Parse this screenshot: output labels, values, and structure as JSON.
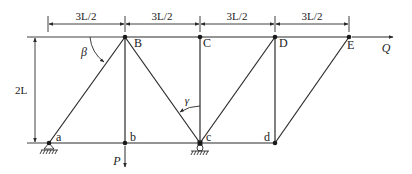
{
  "diagram": {
    "type": "truss",
    "colors": {
      "line": "#2a2a2a",
      "text": "#222222",
      "background": "#ffffff",
      "angle_label": "#555555"
    },
    "nodes": {
      "B": {
        "label": "B",
        "x": 125,
        "y": 37
      },
      "C": {
        "label": "C",
        "x": 200,
        "y": 37
      },
      "D": {
        "label": "D",
        "x": 275,
        "y": 37
      },
      "E": {
        "label": "E",
        "x": 349,
        "y": 37
      },
      "a": {
        "label": "a",
        "x": 49,
        "y": 143
      },
      "b": {
        "label": "b",
        "x": 125,
        "y": 143
      },
      "c": {
        "label": "c",
        "x": 200,
        "y": 143
      },
      "d": {
        "label": "d",
        "x": 275,
        "y": 143
      }
    },
    "members": [
      [
        "B",
        "C"
      ],
      [
        "C",
        "D"
      ],
      [
        "D",
        "E"
      ],
      [
        "a",
        "b"
      ],
      [
        "b",
        "c"
      ],
      [
        "c",
        "d"
      ],
      [
        "a",
        "B"
      ],
      [
        "B",
        "b"
      ],
      [
        "B",
        "c"
      ],
      [
        "C",
        "c"
      ],
      [
        "c",
        "D"
      ],
      [
        "D",
        "d"
      ],
      [
        "d",
        "E"
      ]
    ],
    "dimensions": {
      "spans": [
        "3L/2",
        "3L/2",
        "3L/2",
        "3L/2"
      ],
      "height": "2L"
    },
    "angles": {
      "beta": "β",
      "gamma": "γ"
    },
    "loads": {
      "P": {
        "label": "P",
        "node": "b",
        "direction": "down"
      },
      "Q": {
        "label": "Q",
        "node": "E",
        "direction": "right"
      }
    },
    "supports": {
      "a": "pin",
      "c": "roller"
    }
  }
}
